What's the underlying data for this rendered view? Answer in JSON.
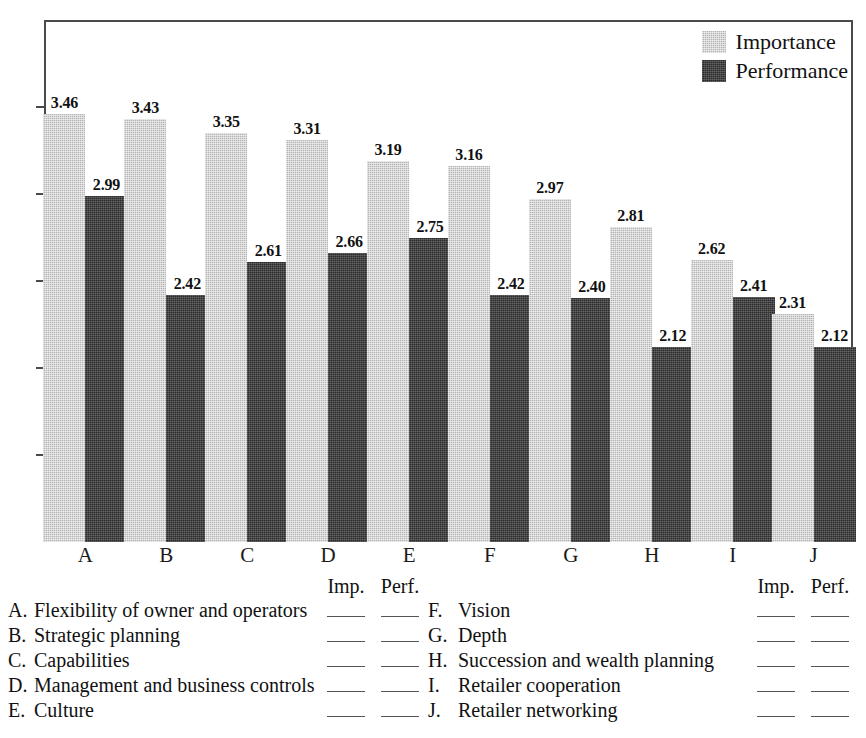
{
  "chart_data": {
    "type": "bar",
    "title": "",
    "xlabel": "",
    "ylabel": "",
    "ylim": [
      1,
      4
    ],
    "yticks": [
      "1",
      "1.5",
      "2",
      "2.5",
      "3",
      "3.5",
      "4"
    ],
    "grid": false,
    "legend_position": "top-right inside plot",
    "categories": [
      "A",
      "B",
      "C",
      "D",
      "E",
      "F",
      "G",
      "H",
      "I",
      "J"
    ],
    "series": [
      {
        "name": "Importance",
        "color": "#b4b4b4",
        "values": [
          3.46,
          3.43,
          3.35,
          3.31,
          3.19,
          3.16,
          2.97,
          2.81,
          2.62,
          2.31
        ],
        "labels": [
          "3.46",
          "3.43",
          "3.35",
          "3.31",
          "3.19",
          "3.16",
          "2.97",
          "2.81",
          "2.62",
          "2.31"
        ]
      },
      {
        "name": "Performance",
        "color": "#2b2b2b",
        "values": [
          2.99,
          2.42,
          2.61,
          2.66,
          2.75,
          2.42,
          2.4,
          2.12,
          2.41,
          2.12
        ],
        "labels": [
          "2.99",
          "2.42",
          "2.61",
          "2.66",
          "2.75",
          "2.42",
          "2.40",
          "2.12",
          "2.41",
          "2.12"
        ]
      }
    ]
  },
  "legend": {
    "items": [
      {
        "label": "Importance",
        "swatch": "importance-swatch"
      },
      {
        "label": "Performance",
        "swatch": "performance-swatch"
      }
    ]
  },
  "key": {
    "headers": {
      "importance": "Imp.",
      "performance": "Perf."
    },
    "left": [
      {
        "letter": "A.",
        "text": "Flexibility of owner and operators"
      },
      {
        "letter": "B.",
        "text": "Strategic planning"
      },
      {
        "letter": "C.",
        "text": "Capabilities"
      },
      {
        "letter": "D.",
        "text": "Management and business controls"
      },
      {
        "letter": "E.",
        "text": "Culture"
      }
    ],
    "right": [
      {
        "letter": "F.",
        "text": "Vision"
      },
      {
        "letter": "G.",
        "text": "Depth"
      },
      {
        "letter": "H.",
        "text": "Succession and wealth planning"
      },
      {
        "letter": "I.",
        "text": "Retailer cooperation"
      },
      {
        "letter": "J.",
        "text": "Retailer networking"
      }
    ]
  }
}
